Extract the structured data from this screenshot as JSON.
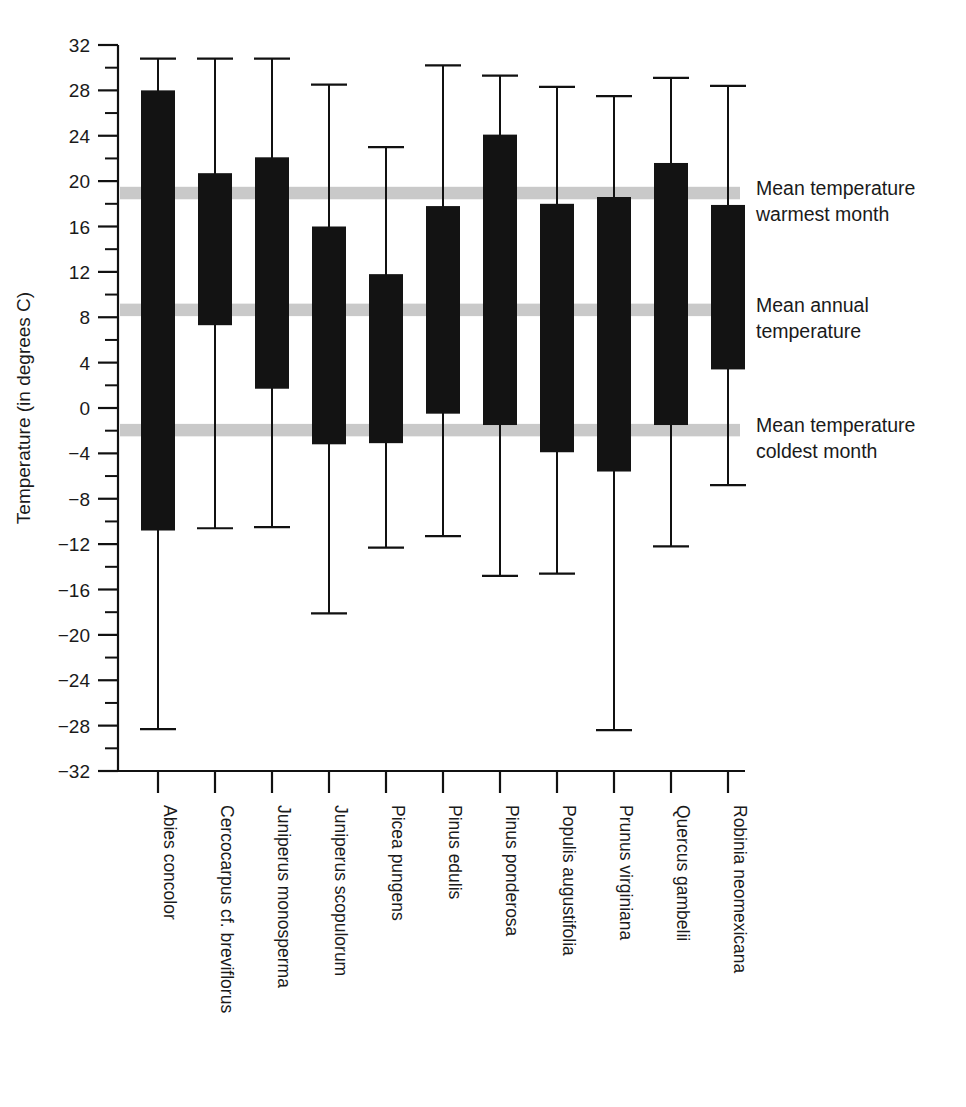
{
  "chart_data": {
    "type": "bar",
    "subtype": "floating-range-bars-with-whiskers",
    "title": "",
    "xlabel": "",
    "ylabel": "Temperature (in degrees C)",
    "ylim": [
      -32,
      32
    ],
    "ytick_step_major": 4,
    "ytick_step_minor": 2,
    "grid": false,
    "legend_position": "right-inline-annotations",
    "ytick_labels": [
      "32",
      "28",
      "24",
      "20",
      "16",
      "12",
      "8",
      "4",
      "0",
      "-4",
      "-8",
      "-12",
      "-16",
      "-20",
      "-24",
      "-28",
      "-32"
    ],
    "categories": [
      "Abies concolor",
      "Cercocarpus cf. breviflorus",
      "Juniperus monosperma",
      "Juniperus scopulorum",
      "Picea pungens",
      "Pinus edulis",
      "Pinus ponderosa",
      "Populis augustifolia",
      "Prunus virginiana",
      "Quercus gambelii",
      "Robinia neomexicana"
    ],
    "series": [
      {
        "name": "Box (interquartile range)",
        "box_top": [
          28.0,
          20.7,
          22.1,
          16.0,
          11.8,
          17.8,
          24.1,
          18.0,
          18.6,
          21.6,
          17.9
        ],
        "box_bottom": [
          -10.8,
          7.3,
          1.7,
          -3.2,
          -3.1,
          -0.5,
          -1.5,
          -3.9,
          -5.6,
          -1.5,
          3.4
        ]
      },
      {
        "name": "Whiskers (extremes)",
        "whisker_top": [
          30.8,
          30.8,
          30.8,
          28.5,
          23.0,
          30.2,
          29.3,
          28.3,
          27.5,
          29.1,
          28.4
        ],
        "whisker_bottom": [
          -28.3,
          -10.6,
          -10.5,
          -18.1,
          -12.3,
          -11.3,
          -14.8,
          -14.6,
          -28.4,
          -12.2,
          -6.8
        ]
      }
    ],
    "annotations": [
      {
        "id": "warmest",
        "label_line1": "Mean temperature",
        "label_line2": "warmest month",
        "band_top": 19.5,
        "band_bottom": 18.4
      },
      {
        "id": "annual",
        "label_line1": "Mean annual",
        "label_line2": "temperature",
        "band_top": 9.2,
        "band_bottom": 8.1
      },
      {
        "id": "coldest",
        "label_line1": "Mean temperature",
        "label_line2": "coldest month",
        "band_top": -1.4,
        "band_bottom": -2.5
      }
    ],
    "colors": {
      "box_fill": "#131313",
      "band_fill": "#c9c9c9",
      "axis": "#111111",
      "text": "#1a1a1a",
      "background": "#ffffff"
    }
  }
}
